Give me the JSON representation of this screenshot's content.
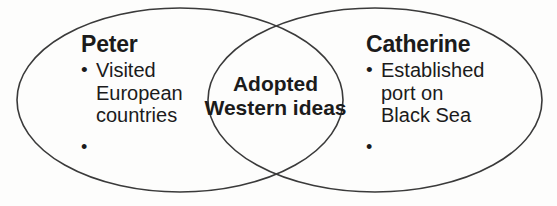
{
  "diagram": {
    "type": "venn",
    "title": "",
    "background_color": "#fdfdfc",
    "stroke_color": "#3a3a3a",
    "text_color": "#1b1b1b",
    "sets": [
      {
        "id": "peter",
        "heading": "Peter",
        "bullets": [
          "Visited\nEuropean\ncountries",
          ""
        ]
      },
      {
        "id": "catherine",
        "heading": "Catherine",
        "bullets": [
          "Established\nport on\nBlack Sea",
          ""
        ]
      }
    ],
    "intersection": {
      "id": "shared",
      "label": "Adopted\nWestern ideas"
    }
  }
}
